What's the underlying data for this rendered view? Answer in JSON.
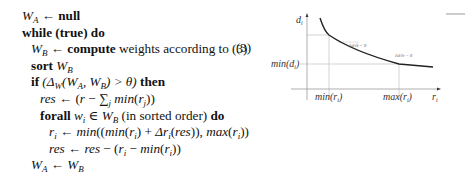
{
  "algorithm": {
    "lines": [
      {
        "indent": 0,
        "parts": [
          {
            "t": "W",
            "s": "m"
          },
          {
            "t": "A",
            "s": "sub"
          },
          {
            "t": " ← ",
            "s": ""
          },
          {
            "t": "null",
            "s": "kw"
          }
        ]
      },
      {
        "indent": 0,
        "parts": [
          {
            "t": "while (true) do",
            "s": "kw"
          }
        ]
      },
      {
        "indent": 1,
        "parts": [
          {
            "t": "W",
            "s": "m"
          },
          {
            "t": "B",
            "s": "sub"
          },
          {
            "t": " ← ",
            "s": ""
          },
          {
            "t": "compute",
            "s": "kw"
          },
          {
            "t": " weights according to (3)",
            "s": ""
          }
        ]
      },
      {
        "indent": 1,
        "parts": [
          {
            "t": "sort ",
            "s": "kw"
          },
          {
            "t": "W",
            "s": "m"
          },
          {
            "t": "B",
            "s": "sub"
          }
        ]
      },
      {
        "indent": 1,
        "parts": [
          {
            "t": "if ",
            "s": "kw"
          },
          {
            "t": "(Δ",
            "s": "m"
          },
          {
            "t": "W",
            "s": "sub"
          },
          {
            "t": "(W",
            "s": "m"
          },
          {
            "t": "A",
            "s": "sub"
          },
          {
            "t": ", W",
            "s": "m"
          },
          {
            "t": "B",
            "s": "sub"
          },
          {
            "t": ") > θ)",
            "s": "m"
          },
          {
            "t": " then",
            "s": "kw"
          }
        ]
      },
      {
        "indent": 2,
        "parts": [
          {
            "t": "res",
            "s": "m"
          },
          {
            "t": " ← (",
            "s": ""
          },
          {
            "t": "r",
            "s": "m"
          },
          {
            "t": " − ∑",
            "s": ""
          },
          {
            "t": "j",
            "s": "sub"
          },
          {
            "t": " min",
            "s": "m"
          },
          {
            "t": "(",
            "s": ""
          },
          {
            "t": "r",
            "s": "m"
          },
          {
            "t": "j",
            "s": "sub"
          },
          {
            "t": "))",
            "s": ""
          }
        ]
      },
      {
        "indent": 2,
        "parts": [
          {
            "t": "forall ",
            "s": "kw"
          },
          {
            "t": "w",
            "s": "m"
          },
          {
            "t": "i",
            "s": "sub"
          },
          {
            "t": " ∈ ",
            "s": ""
          },
          {
            "t": "W",
            "s": "m"
          },
          {
            "t": "B",
            "s": "sub"
          },
          {
            "t": " (in sorted order) ",
            "s": ""
          },
          {
            "t": "do",
            "s": "kw"
          }
        ]
      },
      {
        "indent": 3,
        "parts": [
          {
            "t": "r",
            "s": "m"
          },
          {
            "t": "i",
            "s": "sub"
          },
          {
            "t": " ← ",
            "s": ""
          },
          {
            "t": "min",
            "s": "m"
          },
          {
            "t": "((",
            "s": ""
          },
          {
            "t": "min",
            "s": "m"
          },
          {
            "t": "(",
            "s": ""
          },
          {
            "t": "r",
            "s": "m"
          },
          {
            "t": "i",
            "s": "sub"
          },
          {
            "t": ") + ",
            "s": ""
          },
          {
            "t": "Δr",
            "s": "m"
          },
          {
            "t": "i",
            "s": "sub"
          },
          {
            "t": "(",
            "s": ""
          },
          {
            "t": "res",
            "s": "m"
          },
          {
            "t": ")), ",
            "s": ""
          },
          {
            "t": "max",
            "s": "m"
          },
          {
            "t": "(",
            "s": ""
          },
          {
            "t": "r",
            "s": "m"
          },
          {
            "t": "i",
            "s": "sub"
          },
          {
            "t": "))",
            "s": ""
          }
        ]
      },
      {
        "indent": 3,
        "parts": [
          {
            "t": "res",
            "s": "m"
          },
          {
            "t": " ← ",
            "s": ""
          },
          {
            "t": "res",
            "s": "m"
          },
          {
            "t": " − (",
            "s": ""
          },
          {
            "t": "r",
            "s": "m"
          },
          {
            "t": "i",
            "s": "sub"
          },
          {
            "t": " − ",
            "s": ""
          },
          {
            "t": "min",
            "s": "m"
          },
          {
            "t": "(",
            "s": ""
          },
          {
            "t": "r",
            "s": "m"
          },
          {
            "t": "i",
            "s": "sub"
          },
          {
            "t": "))",
            "s": ""
          }
        ]
      },
      {
        "indent": 1,
        "parts": [
          {
            "t": "W",
            "s": "m"
          },
          {
            "t": "A",
            "s": "sub"
          },
          {
            "t": " ← ",
            "s": ""
          },
          {
            "t": "W",
            "s": "m"
          },
          {
            "t": "B",
            "s": "sub"
          }
        ]
      },
      {
        "indent": 1,
        "parts": [
          {
            "t": "sleep ",
            "s": "kw"
          },
          {
            "t": "delay",
            "s": "m"
          }
        ]
      }
    ]
  },
  "equation_number": "(3)",
  "figure": {
    "y_axis_label": "d",
    "y_axis_sub": "i",
    "x_axis_label": "r",
    "x_axis_sub": "i",
    "y_tick_label": "min(d",
    "y_tick_sub": "i",
    "y_tick_close": ")",
    "x_tick_min": "min(r",
    "x_tick_max": "max(r",
    "x_tick_sub": "i",
    "x_tick_close": ")",
    "slope_annotation_1": "∂d/∂r < 0",
    "slope_annotation_2": "∂d/∂r = 0",
    "colors": {
      "curve": "#222222",
      "axis": "#999999",
      "guide": "#c8c8c8"
    }
  }
}
